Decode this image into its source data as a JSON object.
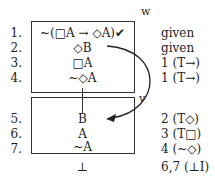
{
  "diagram": {
    "type": "modal tree proof",
    "worlds": [
      {
        "label": "w",
        "box": {
          "x": 31,
          "y": 21,
          "w": 103,
          "h": 71
        }
      },
      {
        "label": "v",
        "box": {
          "x": 31,
          "y": 97,
          "w": 103,
          "h": 56
        }
      }
    ],
    "lines": [
      {
        "num": "1.",
        "formula": "~(□A → ◇A)✔",
        "justification": "given"
      },
      {
        "num": "2.",
        "formula": "◇B",
        "justification": "given"
      },
      {
        "num": "3.",
        "formula": "□A",
        "justification": "1 (T→)"
      },
      {
        "num": "4.",
        "formula": "~◇A",
        "justification": "1 (T→)"
      },
      {
        "num": "5.",
        "formula": "B",
        "justification": "2 (T◇)"
      },
      {
        "num": "6.",
        "formula": "A",
        "justification": "3 (T□)"
      },
      {
        "num": "7.",
        "formula": "~A",
        "justification": "4 (~◇)"
      },
      {
        "num": "",
        "formula": "⊥",
        "justification": "6,7 (⊥I)"
      }
    ],
    "arrow": {
      "from_line": 2,
      "to_line": 5,
      "label": "v"
    },
    "colors": {
      "ink": "#222222",
      "background": "#ffffff"
    }
  }
}
